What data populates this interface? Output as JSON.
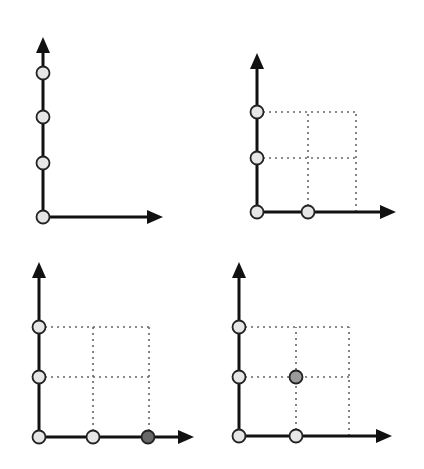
{
  "diagram": {
    "colors": {
      "axis": "#111111",
      "grid": "#666666",
      "point_empty": "#e6e6e6",
      "point_dark": "#686868",
      "point_gray": "#9a9a9a"
    },
    "panels": [
      {
        "id": "panel-1",
        "origin": [
          43,
          217
        ],
        "y_arrow_tip": [
          43,
          37
        ],
        "x_arrow_tip": [
          163,
          217
        ],
        "grid_x": [],
        "grid_y": [],
        "grid_extent": null,
        "points": [
          {
            "x": 43,
            "y": 217,
            "style": "empty"
          },
          {
            "x": 43,
            "y": 163,
            "style": "empty"
          },
          {
            "x": 43,
            "y": 117,
            "style": "empty"
          },
          {
            "x": 43,
            "y": 73,
            "style": "empty"
          }
        ]
      },
      {
        "id": "panel-2",
        "origin": [
          257,
          212
        ],
        "y_arrow_tip": [
          257,
          53
        ],
        "x_arrow_tip": [
          396,
          212
        ],
        "grid_x": [
          308,
          356
        ],
        "grid_y": [
          158,
          112
        ],
        "grid_extent": {
          "x_max": 356,
          "y_min": 112
        },
        "points": [
          {
            "x": 257,
            "y": 212,
            "style": "empty"
          },
          {
            "x": 257,
            "y": 158,
            "style": "empty"
          },
          {
            "x": 257,
            "y": 112,
            "style": "empty"
          },
          {
            "x": 308,
            "y": 212,
            "style": "empty"
          }
        ]
      },
      {
        "id": "panel-3",
        "origin": [
          39,
          437
        ],
        "y_arrow_tip": [
          39,
          262
        ],
        "x_arrow_tip": [
          194,
          437
        ],
        "grid_x": [
          93,
          149
        ],
        "grid_y": [
          377,
          327
        ],
        "grid_extent": {
          "x_max": 149,
          "y_min": 327
        },
        "points": [
          {
            "x": 39,
            "y": 437,
            "style": "empty"
          },
          {
            "x": 39,
            "y": 377,
            "style": "empty"
          },
          {
            "x": 39,
            "y": 327,
            "style": "empty"
          },
          {
            "x": 93,
            "y": 437,
            "style": "empty"
          },
          {
            "x": 148,
            "y": 437,
            "style": "dark"
          }
        ]
      },
      {
        "id": "panel-4",
        "origin": [
          239,
          436
        ],
        "y_arrow_tip": [
          239,
          262
        ],
        "x_arrow_tip": [
          392,
          436
        ],
        "grid_x": [
          296,
          349
        ],
        "grid_y": [
          377,
          327
        ],
        "grid_extent": {
          "x_max": 349,
          "y_min": 327
        },
        "points": [
          {
            "x": 239,
            "y": 436,
            "style": "empty"
          },
          {
            "x": 239,
            "y": 377,
            "style": "empty"
          },
          {
            "x": 239,
            "y": 327,
            "style": "empty"
          },
          {
            "x": 296,
            "y": 436,
            "style": "empty"
          },
          {
            "x": 296,
            "y": 377,
            "style": "gray"
          }
        ]
      }
    ]
  }
}
